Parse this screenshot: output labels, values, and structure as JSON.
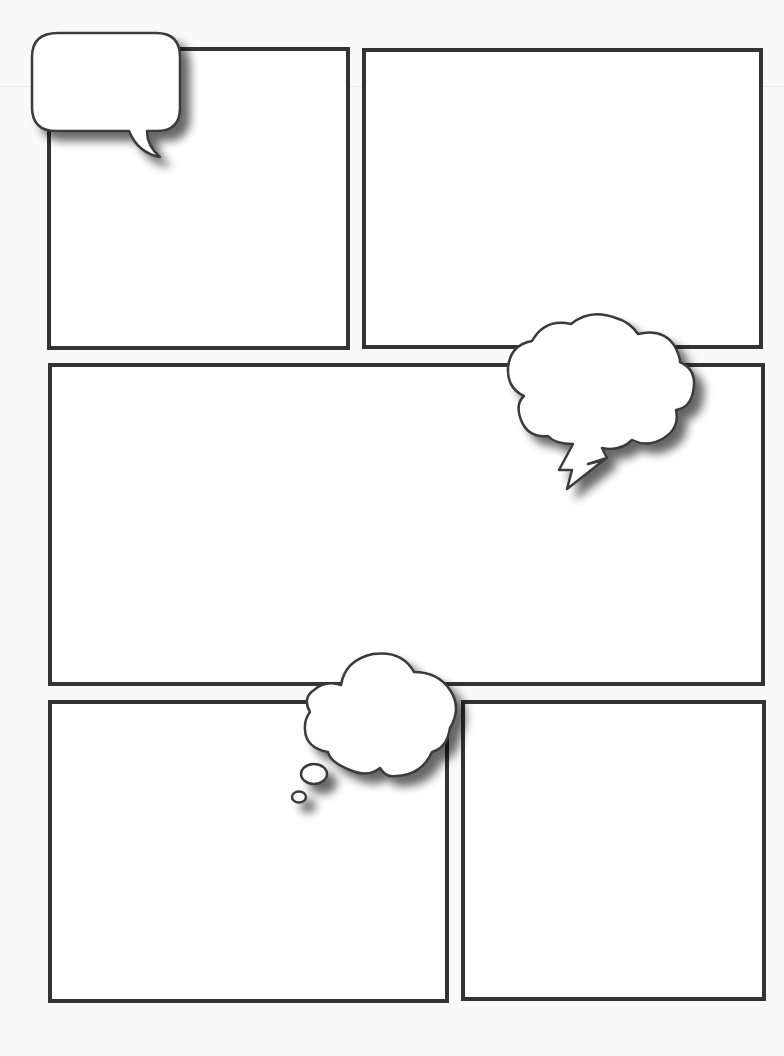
{
  "page": {
    "type": "comic-book-template",
    "background": "#f9f9f9",
    "panel_border_color": "#333333",
    "panel_fill": "#ffffff"
  },
  "panels": [
    {
      "id": "panel-1",
      "x": 47,
      "y": 47,
      "w": 303,
      "h": 303
    },
    {
      "id": "panel-2",
      "x": 362,
      "y": 48,
      "w": 401,
      "h": 301
    },
    {
      "id": "panel-3",
      "x": 48,
      "y": 363,
      "w": 717,
      "h": 323
    },
    {
      "id": "panel-4",
      "x": 48,
      "y": 700,
      "w": 401,
      "h": 303
    },
    {
      "id": "panel-5",
      "x": 461,
      "y": 700,
      "w": 305,
      "h": 301
    }
  ],
  "bubbles": [
    {
      "id": "speech-bubble",
      "kind": "speech",
      "text": ""
    },
    {
      "id": "shout-bubble",
      "kind": "cloud-with-lightning-tail",
      "text": ""
    },
    {
      "id": "thought-bubble",
      "kind": "thought-cloud",
      "text": ""
    }
  ]
}
